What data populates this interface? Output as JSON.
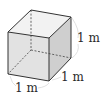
{
  "diagram": {
    "type": "cube",
    "colors": {
      "front_face": "#e2e2e2",
      "right_face": "#cfcfcf",
      "top_face": "#f2f2f2",
      "edge": "#333333",
      "hidden_edge": "#555555",
      "bracket": "#d8d8d8"
    },
    "labels": {
      "height": "1 m",
      "depth": "1 m",
      "width": "1 m"
    }
  }
}
